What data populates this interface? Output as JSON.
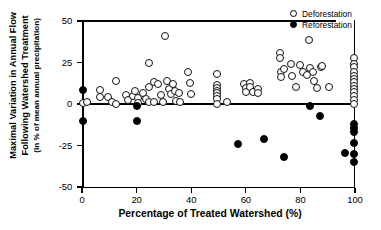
{
  "chart_data": {
    "type": "scatter",
    "title": "",
    "xlabel": "Percentage of Treated Watershed (%)",
    "ylabel_line1": "Maximal Variation in Annual Flow",
    "ylabel_line2": "Following Watershed Treatment",
    "ylabel_line3": "(in % of mean annual precipitation)",
    "xlim": [
      0,
      100
    ],
    "ylim": [
      -50,
      50
    ],
    "xticks": [
      "0",
      "20",
      "40",
      "60",
      "80",
      "100"
    ],
    "xtick_values": [
      0,
      20,
      40,
      60,
      80,
      100
    ],
    "yticks": [
      "50",
      "25",
      "0",
      "-25",
      "-50"
    ],
    "ytick_values": [
      50,
      25,
      0,
      -25,
      -50
    ],
    "grid": false,
    "zero_reference_line": 0,
    "legend_position": "top-right",
    "series": [
      {
        "name": "Deforestation",
        "marker": "open-circle",
        "color": "#000000",
        "fill": "#ffffff",
        "points": [
          [
            0.5,
            0.5
          ],
          [
            2.0,
            1.0
          ],
          [
            6.5,
            8.5
          ],
          [
            6.5,
            4.5
          ],
          [
            9.5,
            4.0
          ],
          [
            11.0,
            1.0
          ],
          [
            12.5,
            14.0
          ],
          [
            12.5,
            0.0
          ],
          [
            16.0,
            5.5
          ],
          [
            17.0,
            2.5
          ],
          [
            18.5,
            5.0
          ],
          [
            19.5,
            8.0
          ],
          [
            20.5,
            3.5
          ],
          [
            20.5,
            0.5
          ],
          [
            22.5,
            6.5
          ],
          [
            23.5,
            3.0
          ],
          [
            24.5,
            25.0
          ],
          [
            24.5,
            10.5
          ],
          [
            24.5,
            1.0
          ],
          [
            26.5,
            13.0
          ],
          [
            26.5,
            1.5
          ],
          [
            28.0,
            12.0
          ],
          [
            29.0,
            5.5
          ],
          [
            29.5,
            1.5
          ],
          [
            30.5,
            41.0
          ],
          [
            31.0,
            14.0
          ],
          [
            32.0,
            9.0
          ],
          [
            32.5,
            6.0
          ],
          [
            33.5,
            12.0
          ],
          [
            34.0,
            8.0
          ],
          [
            34.5,
            2.0
          ],
          [
            35.5,
            6.5
          ],
          [
            36.0,
            1.5
          ],
          [
            39.0,
            19.0
          ],
          [
            39.5,
            12.5
          ],
          [
            40.0,
            6.0
          ],
          [
            49.5,
            18.0
          ],
          [
            49.5,
            11.5
          ],
          [
            49.5,
            9.5
          ],
          [
            49.5,
            8.0
          ],
          [
            49.5,
            6.5
          ],
          [
            49.5,
            5.0
          ],
          [
            49.5,
            3.0
          ],
          [
            49.5,
            0.0
          ],
          [
            53.0,
            1.5
          ],
          [
            59.5,
            12.0
          ],
          [
            60.0,
            9.5
          ],
          [
            60.0,
            7.0
          ],
          [
            61.5,
            12.5
          ],
          [
            61.5,
            10.0
          ],
          [
            62.5,
            7.5
          ],
          [
            64.5,
            9.0
          ],
          [
            64.5,
            6.5
          ],
          [
            72.5,
            31.0
          ],
          [
            72.5,
            28.0
          ],
          [
            73.0,
            19.5
          ],
          [
            73.0,
            16.0
          ],
          [
            74.0,
            21.0
          ],
          [
            76.5,
            24.0
          ],
          [
            77.0,
            17.0
          ],
          [
            78.5,
            10.5
          ],
          [
            80.0,
            23.5
          ],
          [
            81.0,
            19.0
          ],
          [
            82.5,
            17.5
          ],
          [
            83.0,
            38.5
          ],
          [
            83.5,
            21.5
          ],
          [
            84.5,
            19.0
          ],
          [
            85.0,
            14.0
          ],
          [
            86.0,
            9.5
          ],
          [
            87.5,
            22.5
          ],
          [
            88.0,
            23.0
          ],
          [
            90.5,
            10.0
          ],
          [
            99.8,
            28.0
          ],
          [
            99.8,
            24.0
          ],
          [
            99.8,
            22.0
          ],
          [
            99.8,
            19.5
          ],
          [
            99.8,
            17.0
          ],
          [
            99.8,
            15.0
          ],
          [
            99.8,
            13.0
          ],
          [
            99.8,
            11.0
          ],
          [
            99.8,
            9.0
          ],
          [
            99.8,
            7.0
          ],
          [
            99.8,
            5.0
          ],
          [
            99.8,
            2.5
          ],
          [
            99.8,
            0.0
          ]
        ]
      },
      {
        "name": "Reforestation",
        "marker": "filled-circle",
        "color": "#000000",
        "fill": "#000000",
        "points": [
          [
            0.2,
            8.5
          ],
          [
            0.2,
            -10.0
          ],
          [
            20.0,
            -1.5
          ],
          [
            20.0,
            -10.5
          ],
          [
            57.0,
            -24.0
          ],
          [
            66.5,
            -21.0
          ],
          [
            74.0,
            -32.0
          ],
          [
            83.5,
            -1.5
          ],
          [
            87.0,
            -7.0
          ],
          [
            99.8,
            -12.0
          ],
          [
            99.8,
            -14.5
          ],
          [
            99.8,
            -17.0
          ],
          [
            99.8,
            -23.5
          ],
          [
            99.8,
            -30.0
          ],
          [
            99.8,
            -35.0
          ],
          [
            96.5,
            -29.5
          ]
        ]
      }
    ]
  },
  "legend": {
    "items": [
      {
        "label": "Deforestation",
        "marker": "open-circle"
      },
      {
        "label": "Reforestation",
        "marker": "filled-circle"
      }
    ]
  }
}
